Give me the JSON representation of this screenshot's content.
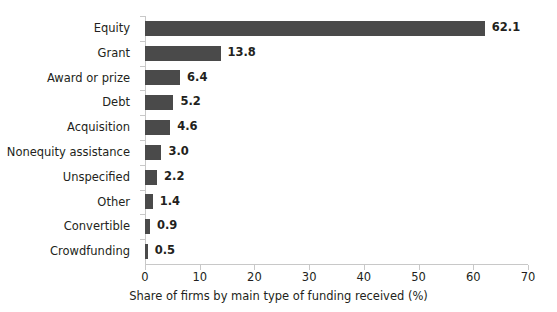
{
  "chart_data": {
    "type": "bar",
    "orientation": "horizontal",
    "title": "",
    "xlabel": "Share of firms by main type of funding received (%)",
    "ylabel": "",
    "categories": [
      "Equity",
      "Grant",
      "Award or prize",
      "Debt",
      "Acquisition",
      "Nonequity assistance",
      "Unspecified",
      "Other",
      "Convertible",
      "Crowdfunding"
    ],
    "values": [
      62.1,
      13.8,
      6.4,
      5.2,
      4.6,
      3.0,
      2.2,
      1.4,
      0.9,
      0.5
    ],
    "value_labels": [
      "62.1",
      "13.8",
      "6.4",
      "5.2",
      "4.6",
      "3.0",
      "2.2",
      "1.4",
      "0.9",
      "0.5"
    ],
    "xlim": [
      0,
      70
    ],
    "xticks": [
      0,
      10,
      20,
      30,
      40,
      50,
      60,
      70
    ],
    "xtick_labels": [
      "0",
      "10",
      "20",
      "30",
      "40",
      "50",
      "60",
      "70"
    ],
    "grid": false,
    "legend": null,
    "bar_color": "#4a4a4a",
    "axis_color": "#c8c8c8",
    "text_color": "#231f20",
    "background": "#ffffff"
  }
}
